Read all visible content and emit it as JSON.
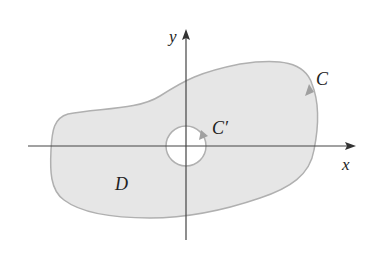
{
  "diagram": {
    "axes": {
      "x_label": "x",
      "y_label": "y"
    },
    "labels": {
      "outer_curve": "C",
      "inner_curve": "C′",
      "region": "D"
    },
    "colors": {
      "region_fill": "#e6e6e6",
      "curve_stroke": "#b0b0b0",
      "axis": "#444444",
      "hole": "#ffffff"
    }
  }
}
